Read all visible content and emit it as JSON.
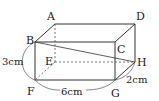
{
  "figure": {
    "type": "rectangular prism (cuboid) diagram",
    "vertices": {
      "A": "A",
      "B": "B",
      "C": "C",
      "D": "D",
      "E": "E",
      "F": "F",
      "G": "G",
      "H": "H"
    },
    "dimensions": {
      "height": "3cm",
      "width": "6cm",
      "depth": "2cm"
    },
    "highlighted_segment": "BH",
    "hidden_edges": [
      "AE",
      "EF",
      "EH"
    ],
    "colors": {
      "line": "#333333",
      "background": "#ffffff"
    }
  }
}
